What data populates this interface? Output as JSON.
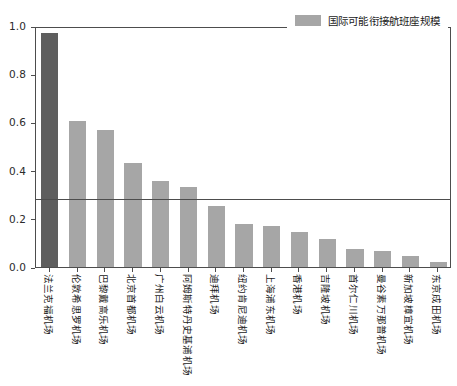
{
  "chart_data": {
    "type": "bar",
    "title": "",
    "xlabel": "",
    "ylabel": "",
    "ylim": [
      0.0,
      1.0
    ],
    "yticks": [
      "0.0",
      "0.2",
      "0.4",
      "0.6",
      "0.8",
      "1.0"
    ],
    "ytick_values": [
      0.0,
      0.2,
      0.4,
      0.6,
      0.8,
      1.0
    ],
    "grid": false,
    "legend_position": "top-right",
    "legend": [
      {
        "label": "国际可能衔接航班座规模",
        "color": "#a6a6a6"
      }
    ],
    "annotations": [
      {
        "type": "hline",
        "value": 0.29,
        "color": "#4d4d4d"
      }
    ],
    "bar_color": "#a6a6a6",
    "highlight_color": "#5e5e5e",
    "categories": [
      "法兰克福机场",
      "伦敦希思罗机场",
      "巴黎戴高乐机场",
      "北京首都机场",
      "广州白云机场",
      "阿姆斯特丹史基浦机场",
      "迪拜机场",
      "纽约肯尼迪机场",
      "上海浦东机场",
      "香港机场",
      "吉隆坡机场",
      "首尔仁川机场",
      "曼谷素万那普机场",
      "新加坡樟宜机场",
      "东京成田机场"
    ],
    "values": [
      0.97,
      0.605,
      0.57,
      0.43,
      0.355,
      0.33,
      0.255,
      0.18,
      0.172,
      0.145,
      0.115,
      0.075,
      0.065,
      0.045,
      0.02
    ],
    "highlight_index": 0
  },
  "axes": {
    "frame_color": "#4d4d4d",
    "tick_color": "#4d4d4d",
    "label_color": "#2b2b2b"
  }
}
